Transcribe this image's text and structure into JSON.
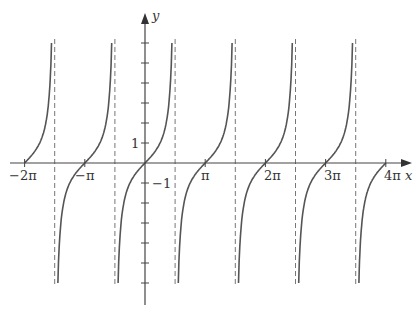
{
  "chart_data": {
    "type": "line",
    "title": "",
    "function": "y = tan x",
    "xlabel": "x",
    "ylabel": "y",
    "xlim": [
      -6.6,
      8.3
    ],
    "ylim": [
      -7.5,
      8
    ],
    "grid": false,
    "legend": null,
    "x_tick_labels": [
      "-2π",
      "-π",
      "π",
      "2π",
      "3π",
      "4π"
    ],
    "x_ticks_multiples_of_pi": [
      -2,
      -1,
      1,
      2,
      3,
      4
    ],
    "y_tick_labels": [
      "1",
      "-1"
    ],
    "y_ticks": [
      -6,
      -5,
      -4,
      -3,
      -2,
      -1,
      1,
      2,
      3,
      4,
      5,
      6
    ],
    "asymptotes_multiples_of_pi": [
      -1.5,
      -0.5,
      0.5,
      1.5,
      2.5,
      3.5
    ],
    "curve_y_range": [
      -6,
      6
    ],
    "series": [
      {
        "name": "tan x",
        "x_range_multiples_of_pi": [
          -2,
          4
        ]
      }
    ],
    "colors": {
      "curve": "#555555",
      "axis": "#444444",
      "asymptote": "#777777"
    }
  },
  "labels": {
    "x_axis": "x",
    "y_axis": "y",
    "ticks": {
      "m2pi": "−2π",
      "mpi": "−π",
      "pi": "π",
      "2pi": "2π",
      "3pi": "3π",
      "4pi": "4π",
      "one": "1",
      "mone": "−1"
    }
  }
}
